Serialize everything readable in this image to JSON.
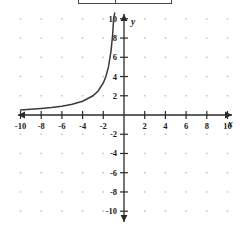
{
  "top_panel": {
    "present": true,
    "label": "",
    "note": "partially cropped bordered box at top edge"
  },
  "chart_data": {
    "type": "line",
    "title": "",
    "xlabel": "x",
    "ylabel": "y",
    "xlim": [
      -10,
      10
    ],
    "ylim": [
      -10,
      10
    ],
    "grid": "dots",
    "grid_step": 2,
    "tick_step": 2,
    "x_ticks": [
      -10,
      -8,
      -6,
      -4,
      -2,
      2,
      4,
      6,
      8,
      10
    ],
    "y_ticks": [
      10,
      8,
      6,
      4,
      2,
      -2,
      -4,
      -6,
      -8,
      -10
    ],
    "x_tick_labels": [
      "-10",
      "-8",
      "-6",
      "-4",
      "-2",
      "2",
      "4",
      "6",
      "8",
      "10"
    ],
    "y_tick_labels": [
      "10",
      "8",
      "6",
      "4",
      "2",
      "-2",
      "-4",
      "-6",
      "-8",
      "-10"
    ],
    "legend": [],
    "annotations": [],
    "series": [
      {
        "name": "branch-upper-left",
        "description": "decreasing branch in quadrant II approaching vertical asymptote x = -0.5 from the left and horizontal asymptote y = 0",
        "x": [
          -10,
          -9,
          -8,
          -7,
          -6,
          -5,
          -4,
          -3,
          -2.5,
          -2,
          -1.75,
          -1.5,
          -1.25,
          -1.1,
          -1.0,
          -0.9,
          -0.8,
          -0.75,
          -0.7,
          -0.66,
          -0.63,
          -0.6,
          -0.58
        ],
        "y": [
          0.53,
          0.59,
          0.67,
          0.77,
          0.91,
          1.11,
          1.43,
          2.0,
          2.5,
          3.33,
          4.0,
          5.0,
          6.67,
          8.33,
          10.0,
          11.1,
          13.3,
          15.0,
          17.5,
          20.0,
          23.0,
          30.0,
          40.0
        ]
      },
      {
        "name": "branch-lower-right",
        "description": "increasing branch in quadrant IV approaching vertical asymptote x = 0.5 from the right and horizontal asymptote y = 0",
        "x": [
          0.5,
          0.55,
          0.6,
          0.65,
          0.7,
          0.8,
          0.9,
          1.0,
          1.25,
          1.5,
          2,
          2.5,
          3,
          4,
          5,
          6,
          7,
          8,
          9,
          10
        ],
        "y": [
          -40.0,
          -30.0,
          -20.0,
          -15.0,
          -12.0,
          -9.0,
          -7.2,
          -6.0,
          -4.4,
          -3.6,
          -2.6,
          -2.1,
          -1.8,
          -1.4,
          -1.15,
          -0.98,
          -0.85,
          -0.76,
          -0.68,
          -0.62
        ]
      }
    ],
    "asymptotes": {
      "vertical_left": -0.5,
      "vertical_right": 0.5,
      "horizontal": 0
    },
    "colors": {
      "curve": "#3a3a3a",
      "axis": "#2b2b2b",
      "grid_dot": "#b9b9b9",
      "background": "#ffffff"
    }
  }
}
